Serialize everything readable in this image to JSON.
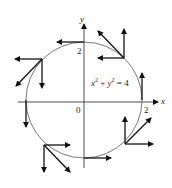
{
  "diagram": {
    "axes": {
      "x_label": "x",
      "y_label": "y",
      "origin_label": "0",
      "x_tick_label": "2",
      "y_tick_label": "2"
    },
    "equation": {
      "base_x": "x",
      "exp_x": "2",
      "plus": " + ",
      "base_y": "y",
      "exp_y": "2",
      "rhs": " = 4"
    },
    "colors": {
      "stroke": "#111111",
      "circle": "#555555"
    }
  }
}
